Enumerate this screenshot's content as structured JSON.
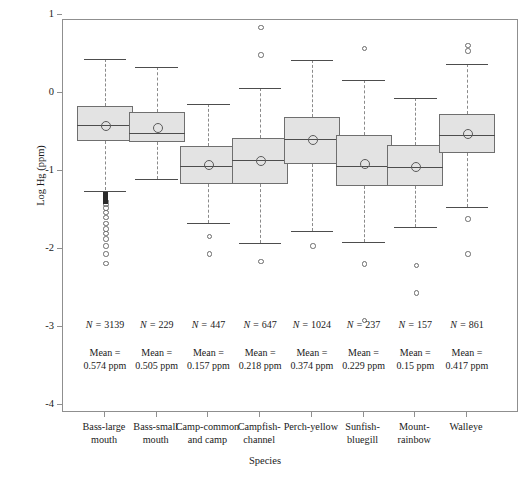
{
  "chart_data": {
    "type": "box",
    "title": "",
    "xlabel": "Species",
    "ylabel": "Log Hg (ppm)",
    "ylim": [
      -4.4,
      1.0
    ],
    "yticks": [
      1,
      0,
      -1,
      -2,
      -3,
      -4
    ],
    "ytick_labels": [
      "1",
      "0",
      "-1",
      "-2",
      "-3",
      "-4"
    ],
    "grid": false,
    "legend": "none",
    "categories": [
      "Bass-largemouth",
      "Bass-smallmouth",
      "Camp-common and camp",
      "Campfish-channel",
      "Perch-yellow",
      "Sunfish-bluegill",
      "Mount-rainbow",
      "Walleye"
    ],
    "category_labels": [
      [
        "Bass-large",
        "mouth"
      ],
      [
        "Bass-small",
        "mouth"
      ],
      [
        "Camp-common",
        "and camp"
      ],
      [
        "Campfish-",
        "channel"
      ],
      [
        "Perch-yellow",
        ""
      ],
      [
        "Sunfish-",
        "bluegill"
      ],
      [
        "Mount-",
        "rainbow"
      ],
      [
        "Walleye",
        ""
      ]
    ],
    "boxes": [
      {
        "name": "Bass-largemouth",
        "whisker_low": -1.25,
        "q1": -0.61,
        "median": -0.41,
        "q3": -0.17,
        "whisker_high": 0.44,
        "mean": -0.404
      },
      {
        "name": "Bass-smallmouth",
        "whisker_low": -1.1,
        "q1": -0.63,
        "median": -0.51,
        "q3": -0.24,
        "whisker_high": 0.33,
        "mean": -0.437
      },
      {
        "name": "Camp-common and camp",
        "whisker_low": -1.67,
        "q1": -1.17,
        "median": -0.94,
        "q3": -0.68,
        "whisker_high": -0.14,
        "mean": -0.916
      },
      {
        "name": "Campfish-channel",
        "whisker_low": -1.92,
        "q1": -1.17,
        "median": -0.86,
        "q3": -0.58,
        "whisker_high": 0.06,
        "mean": -0.862
      },
      {
        "name": "Perch-yellow",
        "whisker_low": -1.77,
        "q1": -0.91,
        "median": -0.59,
        "q3": -0.31,
        "whisker_high": 0.42,
        "mean": -0.588
      },
      {
        "name": "Sunfish-bluegill",
        "whisker_low": -1.91,
        "q1": -1.19,
        "median": -0.94,
        "q3": -0.54,
        "whisker_high": 0.17,
        "mean": -0.898
      },
      {
        "name": "Mount-rainbow",
        "whisker_low": -1.72,
        "q1": -1.19,
        "median": -0.95,
        "q3": -0.67,
        "whisker_high": -0.06,
        "mean": -0.936
      },
      {
        "name": "Walleye",
        "whisker_low": -1.46,
        "q1": -0.77,
        "median": -0.54,
        "q3": -0.27,
        "whisker_high": 0.37,
        "mean": -0.514
      }
    ],
    "outliers": [
      {
        "box": 0,
        "values": [
          -1.38,
          -1.42,
          -1.46,
          -1.52,
          -1.58,
          -1.66,
          -1.73,
          -1.79,
          -1.86,
          -1.95,
          -2.05,
          -2.17
        ]
      },
      {
        "box": 2,
        "values": [
          -1.83,
          -2.05
        ]
      },
      {
        "box": 3,
        "values": [
          0.85,
          0.5,
          -2.15
        ]
      },
      {
        "box": 4,
        "values": [
          -1.95
        ]
      },
      {
        "box": 5,
        "values": [
          0.58,
          -2.18,
          -2.9
        ]
      },
      {
        "box": 6,
        "values": [
          -2.2,
          -2.55
        ]
      },
      {
        "box": 7,
        "values": [
          0.62,
          0.55,
          -1.6,
          -2.05
        ]
      }
    ],
    "annotations": {
      "n_prefix": "N = ",
      "mean_label": "Mean =",
      "n_values": [
        "3139",
        "229",
        "447",
        "647",
        "1024",
        "237",
        "157",
        "861"
      ],
      "mean_values": [
        "0.574 ppm",
        "0.505 ppm",
        "0.157 ppm",
        "0.218 ppm",
        "0.374 ppm",
        "0.229 ppm",
        "0.15 ppm",
        "0.417 ppm"
      ]
    },
    "colors": {
      "box_fill": "#e3e3e3",
      "box_border": "#6f6f6f",
      "median": "#4d4d4d",
      "whisker": "#8a8a8a",
      "axis": "#8f8f8f",
      "text": "#1a1a1a"
    }
  }
}
